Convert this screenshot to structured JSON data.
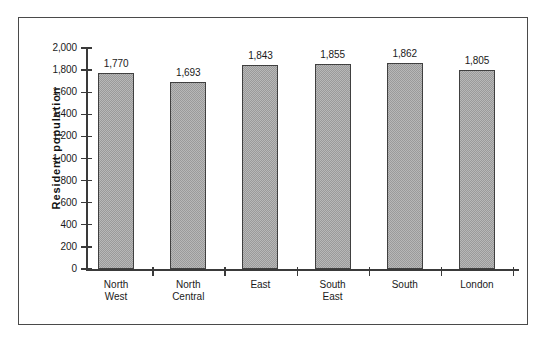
{
  "chart_data": {
    "type": "bar",
    "title": "",
    "xlabel": "",
    "ylabel": "Resident  population",
    "categories": [
      "North West",
      "North Central",
      "East",
      "South East",
      "South",
      "London"
    ],
    "category_lines": [
      [
        "North",
        "West"
      ],
      [
        "North",
        "Central"
      ],
      [
        "East",
        ""
      ],
      [
        "South",
        "East"
      ],
      [
        "South",
        ""
      ],
      [
        "London",
        ""
      ]
    ],
    "values": [
      1770,
      1693,
      1843,
      1855,
      1862,
      1805
    ],
    "value_labels": [
      "1,770",
      "1,693",
      "1,843",
      "1,855",
      "1,862",
      "1,805"
    ],
    "ylim": [
      0,
      2000
    ],
    "ytick_values": [
      0,
      200,
      400,
      600,
      800,
      1000,
      1200,
      1400,
      1600,
      1800,
      2000
    ],
    "ytick_labels": [
      "2,000",
      "1,800",
      "1,600",
      "1,400",
      "1,200",
      "1,000",
      "800",
      "600",
      "400",
      "200",
      "0"
    ],
    "grid": false,
    "legend": null,
    "bar_color": "#9a9a9a",
    "bar_border_color": "#404040",
    "axis_color": "#3a3a3a",
    "frame_color": "#4a4a4a",
    "background_color": "#ffffff"
  }
}
